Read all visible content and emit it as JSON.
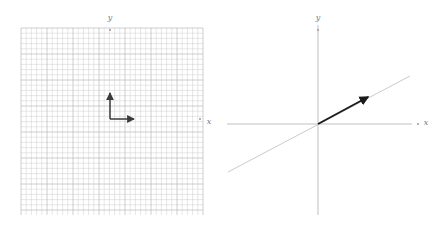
{
  "figure": {
    "background_color": "#ffffff",
    "width": 438,
    "height": 232,
    "panel_count": 2
  },
  "colors": {
    "grid_line": "#c9c9c9",
    "grid_line_major": "#b3b3b3",
    "axis_line": "#b0b0b0",
    "vector_stroke": "#3a3a3a",
    "vector_stroke_bold": "#1a1a1a",
    "diagonal_line": "#bdbdbd",
    "label_text": "#7a7a7a",
    "tick_dot": "#909090"
  },
  "left_panel": {
    "name": "grid-vector-panel",
    "grid": {
      "x_start": 21,
      "y_start": 28,
      "x_end": 203,
      "y_end": 215,
      "spacing": 5.2,
      "major_every": 5,
      "visible": true
    },
    "x_axis_label": "x",
    "y_axis_label": "y",
    "x_label_position": {
      "x": 209,
      "y": 124
    },
    "y_label_position": {
      "x": 110,
      "y": 20
    },
    "x_tick_dot": {
      "x": 200,
      "y": 119
    },
    "y_tick_dot": {
      "x": 110,
      "y": 30
    },
    "origin": {
      "x": 110,
      "y": 119
    },
    "vectors": [
      {
        "name": "vector-up",
        "from": {
          "x": 110,
          "y": 119
        },
        "to": {
          "x": 110,
          "y": 93
        },
        "components": {
          "dx": 0,
          "dy": 5
        },
        "color": "#3a3a3a"
      },
      {
        "name": "vector-right",
        "from": {
          "x": 110,
          "y": 119
        },
        "to": {
          "x": 134,
          "y": 119
        },
        "components": {
          "dx": 5,
          "dy": 0
        },
        "color": "#3a3a3a"
      }
    ]
  },
  "right_panel": {
    "name": "axes-vector-panel",
    "grid": {
      "visible": false
    },
    "x_axis_label": "x",
    "y_axis_label": "y",
    "x_label_position": {
      "x": 207,
      "y": 125
    },
    "y_label_position": {
      "x": 99,
      "y": 20
    },
    "x_tick_dot": {
      "x": 199,
      "y": 124
    },
    "y_tick_dot": {
      "x": 99,
      "y": 30
    },
    "origin": {
      "x": 99,
      "y": 124
    },
    "x_axis": {
      "from": {
        "x": 8,
        "y": 124
      },
      "to": {
        "x": 193,
        "y": 124
      }
    },
    "y_axis": {
      "from": {
        "x": 99,
        "y": 25
      },
      "to": {
        "x": 99,
        "y": 215
      }
    },
    "span_line": {
      "name": "span-line",
      "from": {
        "x": 9,
        "y": 172
      },
      "to": {
        "x": 191,
        "y": 76
      },
      "slope": -0.527,
      "color": "#bdbdbd"
    },
    "vectors": [
      {
        "name": "vector-diagonal",
        "from": {
          "x": 99,
          "y": 124
        },
        "to": {
          "x": 149,
          "y": 97
        },
        "components": {
          "dx": 50,
          "dy": 27
        },
        "color": "#1a1a1a"
      }
    ]
  },
  "chart_data": {
    "type": "scatter",
    "title": "",
    "xlabel": "x",
    "ylabel": "y",
    "panels": [
      {
        "name": "standard-basis-vectors",
        "grid": true,
        "annotations": [
          "vector-up",
          "vector-right"
        ],
        "series": [
          {
            "name": "e2",
            "x": [
              0,
              0
            ],
            "y": [
              0,
              5
            ]
          },
          {
            "name": "e1",
            "x": [
              0,
              5
            ],
            "y": [
              0,
              0
            ]
          }
        ]
      },
      {
        "name": "transformed-vector-on-span",
        "grid": false,
        "annotations": [
          "span-line",
          "vector-diagonal"
        ],
        "series": [
          {
            "name": "v",
            "x": [
              0,
              5
            ],
            "y": [
              0,
              2.7
            ]
          },
          {
            "name": "span",
            "x": [
              -9,
              9.2
            ],
            "y": [
              -4.8,
              4.8
            ]
          }
        ]
      }
    ]
  }
}
